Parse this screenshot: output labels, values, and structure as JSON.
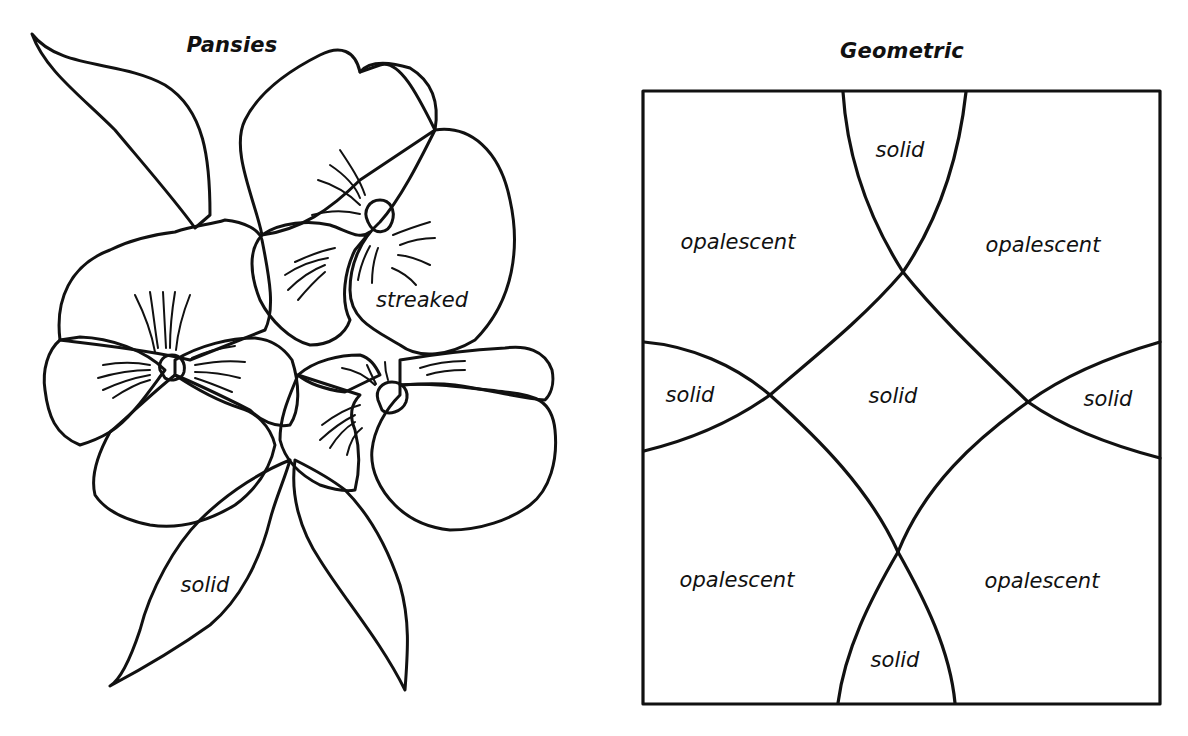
{
  "panels": [
    {
      "title": "Pansies",
      "labels": [
        {
          "text": "streaked",
          "region": "upper-right pansy lower petal"
        },
        {
          "text": "solid",
          "region": "lower-left leaf"
        }
      ]
    },
    {
      "title": "Geometric",
      "labels": [
        {
          "text": "solid",
          "region": "top center"
        },
        {
          "text": "opalescent",
          "region": "upper left"
        },
        {
          "text": "opalescent",
          "region": "upper right"
        },
        {
          "text": "solid",
          "region": "middle left"
        },
        {
          "text": "solid",
          "region": "center"
        },
        {
          "text": "solid",
          "region": "middle right"
        },
        {
          "text": "opalescent",
          "region": "lower left"
        },
        {
          "text": "opalescent",
          "region": "lower right"
        },
        {
          "text": "solid",
          "region": "bottom center"
        }
      ]
    }
  ],
  "colors": {
    "line": "#111111",
    "background": "#ffffff"
  }
}
